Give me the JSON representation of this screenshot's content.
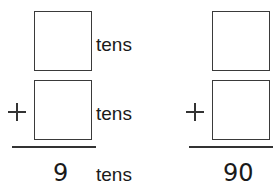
{
  "problems": [
    {
      "addend1_unit": "tens",
      "addend2_unit": "tens",
      "operator": "+",
      "sum": "9",
      "sum_unit": "tens"
    },
    {
      "operator": "+",
      "sum": "90"
    }
  ]
}
